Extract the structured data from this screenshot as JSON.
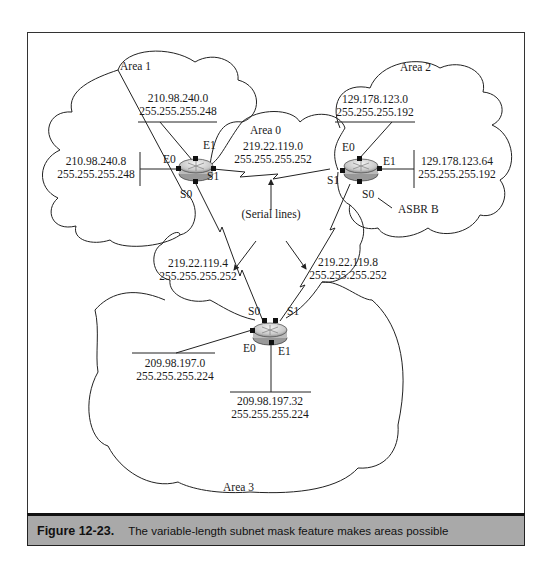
{
  "figure": {
    "number": "Figure 12-23.",
    "caption": "The variable-length subnet mask feature makes areas possible"
  },
  "areas": {
    "area1": "Area 1",
    "area0": "Area 0",
    "area2": "Area 2",
    "area3": "Area 3"
  },
  "routers": {
    "r1": {
      "ports": {
        "e0": "E0",
        "e1": "E1",
        "s0": "S0",
        "s1": "S1"
      }
    },
    "r2": {
      "ports": {
        "e0": "E0",
        "e1": "E1",
        "s0": "S0",
        "s1": "S1"
      },
      "name": "ASBR B"
    },
    "r3": {
      "ports": {
        "e0": "E0",
        "e1": "E1",
        "s0": "S0",
        "s1": "S1"
      }
    }
  },
  "networks": {
    "n1": {
      "addr": "210.98.240.0",
      "mask": "255.255.255.248"
    },
    "n2": {
      "addr": "210.98.240.8",
      "mask": "255.255.255.248"
    },
    "n3": {
      "addr": "219.22.119.0",
      "mask": "255.255.255.252"
    },
    "n4": {
      "addr": "129.178.123.0",
      "mask": "255.255.255.192"
    },
    "n5": {
      "addr": "129.178.123.64",
      "mask": "255.255.255.192"
    },
    "n6": {
      "addr": "219.22.119.4",
      "mask": "255.255.255.252"
    },
    "n7": {
      "addr": "219.22.119.8",
      "mask": "255.255.255.252"
    },
    "n8": {
      "addr": "209.98.197.0",
      "mask": "255.255.255.224"
    },
    "n9": {
      "addr": "209.98.197.32",
      "mask": "255.255.255.224"
    }
  },
  "annotations": {
    "serial_lines": "(Serial lines)"
  }
}
